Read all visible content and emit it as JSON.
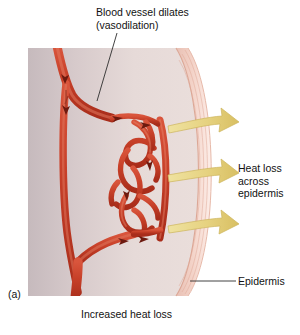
{
  "figure": {
    "panel_label": "(a)",
    "caption": "Increased heat loss",
    "labels": {
      "vasodilation": "Blood vessel dilates\n(vasodilation)",
      "heat_loss": "Heat loss\nacross\nepidermis",
      "epidermis": "Epidermis"
    }
  },
  "icons": {
    "heat_arrow": "heat-loss-arrow-icon",
    "flow_arrow": "blood-flow-arrow-icon"
  },
  "colors": {
    "vessel_red": "#c8412c",
    "vessel_red_dark": "#8d2417",
    "vessel_red_light": "#e06a4f",
    "arrow_yellow": "#e8d887",
    "arrow_yellow_dark": "#c9b152",
    "dermis": "#cfc4c6",
    "dermis_inner": "#e4d7d6",
    "epidermis_band": "#f0c8bd",
    "epidermis_line": "#dca596",
    "leader_line": "#333333",
    "text": "#121212"
  },
  "arrows": {
    "heat_arrow_count": 3
  }
}
